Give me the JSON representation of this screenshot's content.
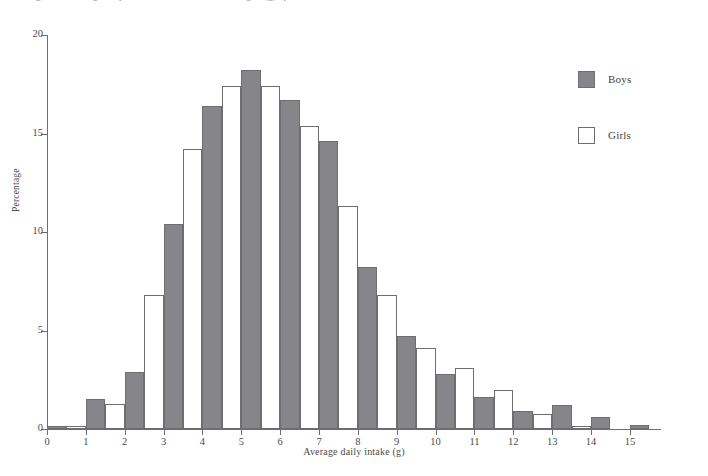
{
  "caption": {
    "text": "Figure 5.9  Average daily intake of non-milk extrinsic sugars (g) by sex"
  },
  "chart_data": {
    "type": "bar",
    "title": "",
    "subtitle": "",
    "xlabel": "Average daily intake (g)",
    "ylabel": "Percentage",
    "xlim": [
      0,
      15.8
    ],
    "ylim": [
      0,
      20
    ],
    "xticks": [
      0,
      1,
      2,
      3,
      4,
      5,
      6,
      7,
      8,
      9,
      10,
      11,
      12,
      13,
      14,
      15
    ],
    "yticks": [
      0,
      5,
      10,
      15,
      20
    ],
    "grid": false,
    "legend_position": "top-right",
    "bin_width": 1,
    "bar_width": 0.5,
    "categories": [
      "0-1",
      "1-2",
      "2-3",
      "3-4",
      "4-5",
      "5-6",
      "6-7",
      "7-8",
      "8-9",
      "9-10",
      "10-11",
      "11-12",
      "12-13",
      "13-14",
      "14-15",
      "15-16"
    ],
    "bin_starts": [
      0,
      1,
      2,
      3,
      4,
      5,
      6,
      7,
      8,
      9,
      10,
      11,
      12,
      13,
      14,
      15
    ],
    "series": [
      {
        "name": "Boys",
        "color": "#85858a",
        "values": [
          0.15,
          1.5,
          2.9,
          10.4,
          16.4,
          18.2,
          16.7,
          14.6,
          8.2,
          4.7,
          2.8,
          1.6,
          0.9,
          1.2,
          0.6,
          0.2
        ]
      },
      {
        "name": "Girls",
        "color": "#ffffff",
        "values": [
          0.15,
          1.25,
          6.8,
          14.2,
          17.4,
          17.4,
          15.4,
          11.3,
          6.8,
          4.1,
          3.1,
          2.0,
          0.75,
          0.15,
          0.0,
          0.0
        ]
      }
    ]
  },
  "legend": {
    "items": [
      {
        "label": "Boys",
        "style": "filled"
      },
      {
        "label": "Girls",
        "style": "outline"
      }
    ]
  },
  "colors": {
    "boys_fill": "#85858a",
    "girls_fill": "#ffffff",
    "outline": "#6d6d72",
    "axis": "#6e6e72",
    "text": "#4a4a4e",
    "background": "#ffffff"
  }
}
